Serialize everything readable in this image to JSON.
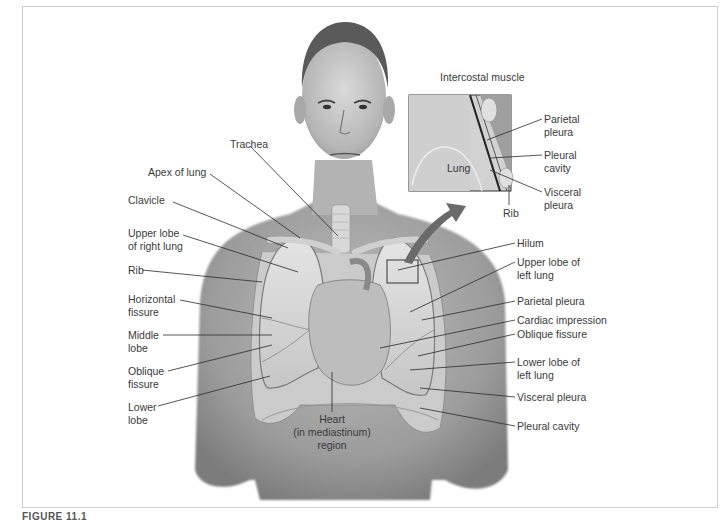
{
  "figure": {
    "caption_fragment": "FIGURE 11.1"
  },
  "labels_left": [
    {
      "id": "trachea",
      "text": "Trachea",
      "x": 230,
      "y": 138
    },
    {
      "id": "apex-of-lung",
      "text": "Apex of lung",
      "x": 148,
      "y": 166
    },
    {
      "id": "clavicle",
      "text": "Clavicle",
      "x": 128,
      "y": 194
    },
    {
      "id": "upper-lobe-right",
      "text": "Upper lobe\nof right lung",
      "x": 128,
      "y": 227
    },
    {
      "id": "rib",
      "text": "Rib",
      "x": 128,
      "y": 264
    },
    {
      "id": "horizontal-fissure",
      "text": "Horizontal\nfissure",
      "x": 128,
      "y": 293
    },
    {
      "id": "middle-lobe",
      "text": "Middle\nlobe",
      "x": 128,
      "y": 329
    },
    {
      "id": "oblique-fissure",
      "text": "Oblique\nfissure",
      "x": 128,
      "y": 365
    },
    {
      "id": "lower-lobe",
      "text": "Lower\nlobe",
      "x": 128,
      "y": 401
    }
  ],
  "labels_right": [
    {
      "id": "hilum",
      "text": "Hilum",
      "x": 517,
      "y": 237
    },
    {
      "id": "upper-lobe-left",
      "text": "Upper lobe of\nleft lung",
      "x": 517,
      "y": 256
    },
    {
      "id": "parietal-pleura",
      "text": "Parietal pleura",
      "x": 517,
      "y": 295
    },
    {
      "id": "cardiac-impression",
      "text": "Cardiac impression",
      "x": 517,
      "y": 314
    },
    {
      "id": "oblique-fissure-left",
      "text": "Oblique fissure",
      "x": 517,
      "y": 328
    },
    {
      "id": "lower-lobe-left",
      "text": "Lower lobe of\nleft lung",
      "x": 517,
      "y": 356
    },
    {
      "id": "visceral-pleura",
      "text": "Visceral pleura",
      "x": 517,
      "y": 391
    },
    {
      "id": "pleural-cavity",
      "text": "Pleural cavity",
      "x": 517,
      "y": 420
    }
  ],
  "label_center": {
    "id": "heart",
    "text": "Heart\n(in mediastinum)\nregion",
    "x": 332,
    "y": 413
  },
  "inset": {
    "title": "Intercostal muscle",
    "lung_label": "Lung",
    "labels": [
      {
        "id": "inset-parietal-pleura",
        "text": "Parietal\npleura",
        "x": 544,
        "y": 113
      },
      {
        "id": "inset-pleural-cavity",
        "text": "Pleural\ncavity",
        "x": 544,
        "y": 149
      },
      {
        "id": "inset-visceral-pleura",
        "text": "Visceral\npleura",
        "x": 544,
        "y": 186
      },
      {
        "id": "inset-rib",
        "text": "Rib",
        "x": 503,
        "y": 207
      }
    ]
  },
  "colors": {
    "frame": "#cfcfcf",
    "text": "#3a3a3a",
    "leader": "#2b2b2b",
    "skin": "#a9a9a9",
    "lung": "#d4d4d4",
    "arrow": "#6a6a6a"
  }
}
